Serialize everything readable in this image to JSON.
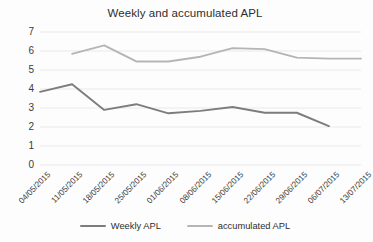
{
  "chart_data": {
    "type": "line",
    "title": "Weekly and accumulated APL",
    "xlabel": "",
    "ylabel": "",
    "ylim": [
      0,
      7
    ],
    "ystep": 1,
    "grid": true,
    "legend_position": "bottom-center",
    "categories": [
      "04/05/2015",
      "11/05/2015",
      "18/05/2015",
      "25/05/2015",
      "01/06/2015",
      "08/06/2015",
      "15/06/2015",
      "22/06/2015",
      "29/06/2015",
      "06/07/2015",
      "13/07/2015"
    ],
    "ytick_labels": [
      "0",
      "1",
      "2",
      "3",
      "4",
      "5",
      "6",
      "7"
    ],
    "series": [
      {
        "name": "Weekly APL",
        "color": "#7d7d7d",
        "values": [
          3.85,
          4.25,
          2.9,
          3.2,
          2.72,
          2.85,
          3.05,
          2.75,
          2.75,
          2.05,
          null
        ]
      },
      {
        "name": "accumulated APL",
        "color": "#b5b5b5",
        "values": [
          null,
          5.85,
          6.3,
          5.45,
          5.45,
          5.7,
          6.15,
          6.1,
          5.65,
          5.6,
          5.6
        ]
      }
    ]
  },
  "legend": {
    "items": [
      {
        "label": "Weekly APL",
        "color": "#7d7d7d"
      },
      {
        "label": "accumulated APL",
        "color": "#b5b5b5"
      }
    ]
  },
  "colors": {
    "background": "#fdfdfd",
    "grid": "#e9e9e9",
    "text": "#3b3b3b",
    "weekly": "#7d7d7d",
    "accumulated": "#b5b5b5"
  }
}
